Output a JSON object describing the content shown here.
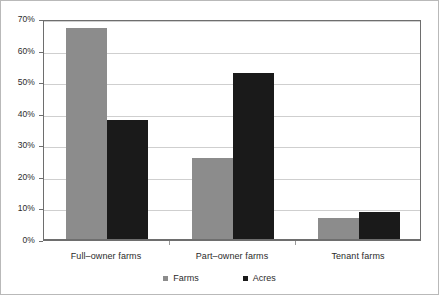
{
  "chart_data": {
    "type": "bar",
    "title": "",
    "xlabel": "",
    "ylabel": "",
    "categories": [
      "Full–owner farms",
      "Part–owner farms",
      "Tenant farms"
    ],
    "series": [
      {
        "name": "Farms",
        "color": "#8c8c8c",
        "values": [
          67,
          26,
          7
        ]
      },
      {
        "name": "Acres",
        "color": "#1a1a1a",
        "values": [
          38,
          53,
          9
        ]
      }
    ],
    "ylim": [
      0,
      70
    ],
    "ytick_values": [
      0,
      10,
      20,
      30,
      40,
      50,
      60,
      70
    ],
    "ytick_labels": [
      "0%",
      "10%",
      "20%",
      "30%",
      "40%",
      "50%",
      "60%",
      "70%"
    ],
    "grid": true,
    "grid_axis": "y",
    "legend_position": "bottom-center",
    "value_format": "percent"
  },
  "legend": {
    "items": [
      {
        "label": "Farms",
        "marker": "square-marker-gray"
      },
      {
        "label": "Acres",
        "marker": "square-marker-black"
      }
    ]
  },
  "colors": {
    "farms": "#8c8c8c",
    "acres": "#1a1a1a",
    "gridline": "#cfcfcf",
    "axis": "#6e6e6e",
    "figure_border": "#b9b9b9",
    "text": "#2b2b2b",
    "background": "#ffffff"
  }
}
